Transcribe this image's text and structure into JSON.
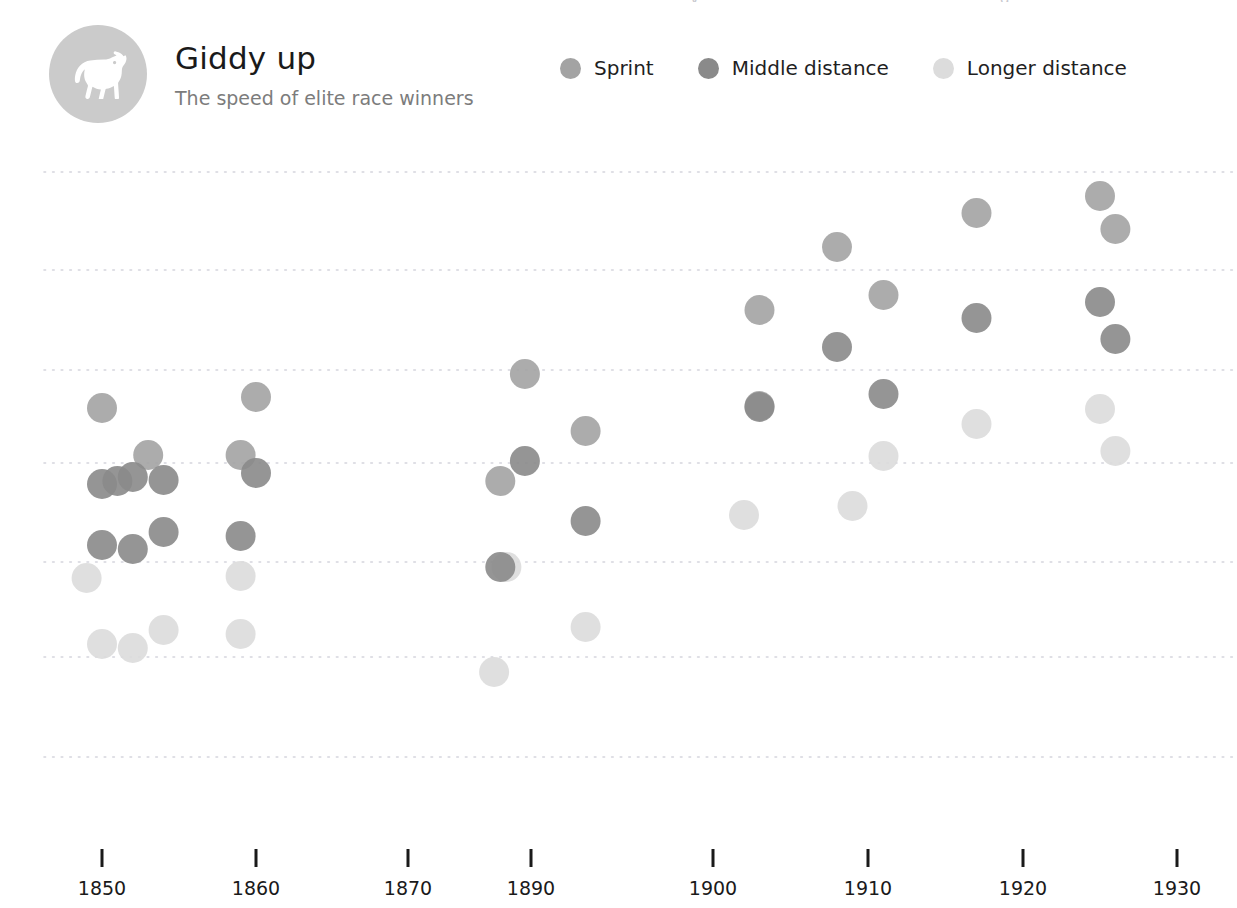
{
  "header": {
    "logo_icon": "horse-icon",
    "title": "Giddy up",
    "subtitle": "The speed of elite race winners"
  },
  "clipped_top_text": {
    "fragment_left": "y",
    "fragment_right": "g,"
  },
  "legend": {
    "items": [
      {
        "label": "Sprint",
        "color": "#a3a3a3"
      },
      {
        "label": "Middle distance",
        "color": "#8a8a8a"
      },
      {
        "label": "Longer distance",
        "color": "#dcdcdc"
      }
    ]
  },
  "chart_data": {
    "type": "scatter",
    "title": "Giddy up",
    "subtitle": "The speed of elite race winners",
    "xlabel": "",
    "ylabel": "",
    "grid": true,
    "grid_style": "dotted-horizontal",
    "legend_position": "top-right",
    "xlim": [
      1845,
      1933
    ],
    "x_ticks": [
      1850,
      1860,
      1870,
      1890,
      1900,
      1910,
      1920,
      1930
    ],
    "x_tick_labels": [
      "1850",
      "1860",
      "1870",
      "1890",
      "1900",
      "1910",
      "1920",
      "1930"
    ],
    "x_tick_pixels": [
      102,
      256,
      408,
      531,
      713,
      868,
      1023,
      1177
    ],
    "y_gridline_pixels": [
      172,
      270,
      370,
      463,
      562,
      657,
      757
    ],
    "y_axis_labels_visible": false,
    "marker_radius_px": 15,
    "marker_opacity": 0.9,
    "series": [
      {
        "name": "Sprint",
        "color": "#a3a3a3",
        "points": [
          {
            "x": 1850,
            "y_px": 408
          },
          {
            "x": 1853,
            "y_px": 455
          },
          {
            "x": 1860,
            "y_px": 397
          },
          {
            "x": 1859,
            "y_px": 455
          },
          {
            "x": 1889,
            "y_px": 374
          },
          {
            "x": 1885,
            "y_px": 481
          },
          {
            "x": 1893,
            "y_px": 431
          },
          {
            "x": 1903,
            "y_px": 310
          },
          {
            "x": 1903,
            "y_px": 406
          },
          {
            "x": 1908,
            "y_px": 247
          },
          {
            "x": 1911,
            "y_px": 295
          },
          {
            "x": 1917,
            "y_px": 213
          },
          {
            "x": 1925,
            "y_px": 196
          },
          {
            "x": 1926,
            "y_px": 229
          }
        ]
      },
      {
        "name": "Middle distance",
        "color": "#8a8a8a",
        "points": [
          {
            "x": 1850,
            "y_px": 484
          },
          {
            "x": 1851,
            "y_px": 481
          },
          {
            "x": 1852,
            "y_px": 477
          },
          {
            "x": 1854,
            "y_px": 480
          },
          {
            "x": 1860,
            "y_px": 473
          },
          {
            "x": 1850,
            "y_px": 545
          },
          {
            "x": 1852,
            "y_px": 549
          },
          {
            "x": 1854,
            "y_px": 532
          },
          {
            "x": 1859,
            "y_px": 536
          },
          {
            "x": 1885,
            "y_px": 567
          },
          {
            "x": 1889,
            "y_px": 461
          },
          {
            "x": 1893,
            "y_px": 521
          },
          {
            "x": 1903,
            "y_px": 407
          },
          {
            "x": 1908,
            "y_px": 347
          },
          {
            "x": 1911,
            "y_px": 394
          },
          {
            "x": 1917,
            "y_px": 318
          },
          {
            "x": 1925,
            "y_px": 302
          },
          {
            "x": 1926,
            "y_px": 339
          }
        ]
      },
      {
        "name": "Longer distance",
        "color": "#dcdcdc",
        "points": [
          {
            "x": 1849,
            "y_px": 578
          },
          {
            "x": 1850,
            "y_px": 644
          },
          {
            "x": 1852,
            "y_px": 648
          },
          {
            "x": 1854,
            "y_px": 630
          },
          {
            "x": 1859,
            "y_px": 576
          },
          {
            "x": 1859,
            "y_px": 634
          },
          {
            "x": 1886,
            "y_px": 567
          },
          {
            "x": 1884,
            "y_px": 672
          },
          {
            "x": 1893,
            "y_px": 627
          },
          {
            "x": 1902,
            "y_px": 515
          },
          {
            "x": 1909,
            "y_px": 506
          },
          {
            "x": 1911,
            "y_px": 456
          },
          {
            "x": 1917,
            "y_px": 424
          },
          {
            "x": 1925,
            "y_px": 409
          },
          {
            "x": 1926,
            "y_px": 451
          }
        ]
      }
    ]
  }
}
